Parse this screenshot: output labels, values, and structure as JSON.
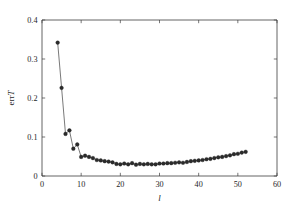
{
  "figure": {
    "background_color": "#ffffff",
    "line_color": "#4c4c4c",
    "marker_color": "#2b2b2b",
    "axis_color": "#3d3d3d"
  },
  "chart_data": {
    "type": "line",
    "title": "",
    "subtitle": "",
    "xlabel": "l",
    "ylabel": "errT",
    "ylabel_parts": {
      "prefix": "err",
      "italic": "T"
    },
    "xlim": [
      0,
      60
    ],
    "ylim": [
      0,
      0.4
    ],
    "xticks": [
      0,
      10,
      20,
      30,
      40,
      50,
      60
    ],
    "xtick_labels": [
      "0",
      "10",
      "20",
      "30",
      "40",
      "50",
      "60"
    ],
    "yticks": [
      0,
      0.1,
      0.2,
      0.3,
      0.4
    ],
    "ytick_labels": [
      "0",
      "0.1",
      "0.2",
      "0.3",
      "0.4"
    ],
    "grid": false,
    "legend": null,
    "legend_position": "none",
    "tick_direction": "in",
    "marker": "circle",
    "x": [
      4,
      5,
      6,
      7,
      8,
      9,
      10,
      11,
      12,
      13,
      14,
      15,
      16,
      17,
      18,
      19,
      20,
      21,
      22,
      23,
      24,
      25,
      26,
      27,
      28,
      29,
      30,
      31,
      32,
      33,
      34,
      35,
      36,
      37,
      38,
      39,
      40,
      41,
      42,
      43,
      44,
      45,
      46,
      47,
      48,
      49,
      50,
      51,
      52
    ],
    "y": [
      0.342,
      0.226,
      0.108,
      0.117,
      0.07,
      0.081,
      0.049,
      0.052,
      0.049,
      0.046,
      0.041,
      0.04,
      0.038,
      0.037,
      0.035,
      0.031,
      0.03,
      0.032,
      0.03,
      0.033,
      0.029,
      0.031,
      0.03,
      0.031,
      0.03,
      0.03,
      0.032,
      0.032,
      0.033,
      0.033,
      0.034,
      0.035,
      0.034,
      0.036,
      0.038,
      0.039,
      0.04,
      0.041,
      0.043,
      0.044,
      0.046,
      0.048,
      0.049,
      0.051,
      0.053,
      0.056,
      0.057,
      0.06,
      0.062
    ],
    "series": [
      {
        "name": "errT",
        "values": [
          0.342,
          0.226,
          0.108,
          0.117,
          0.07,
          0.081,
          0.049,
          0.052,
          0.049,
          0.046,
          0.041,
          0.04,
          0.038,
          0.037,
          0.035,
          0.031,
          0.03,
          0.032,
          0.03,
          0.033,
          0.029,
          0.031,
          0.03,
          0.031,
          0.03,
          0.03,
          0.032,
          0.032,
          0.033,
          0.033,
          0.034,
          0.035,
          0.034,
          0.036,
          0.038,
          0.039,
          0.04,
          0.041,
          0.043,
          0.044,
          0.046,
          0.048,
          0.049,
          0.051,
          0.053,
          0.056,
          0.057,
          0.06,
          0.062
        ]
      }
    ]
  }
}
